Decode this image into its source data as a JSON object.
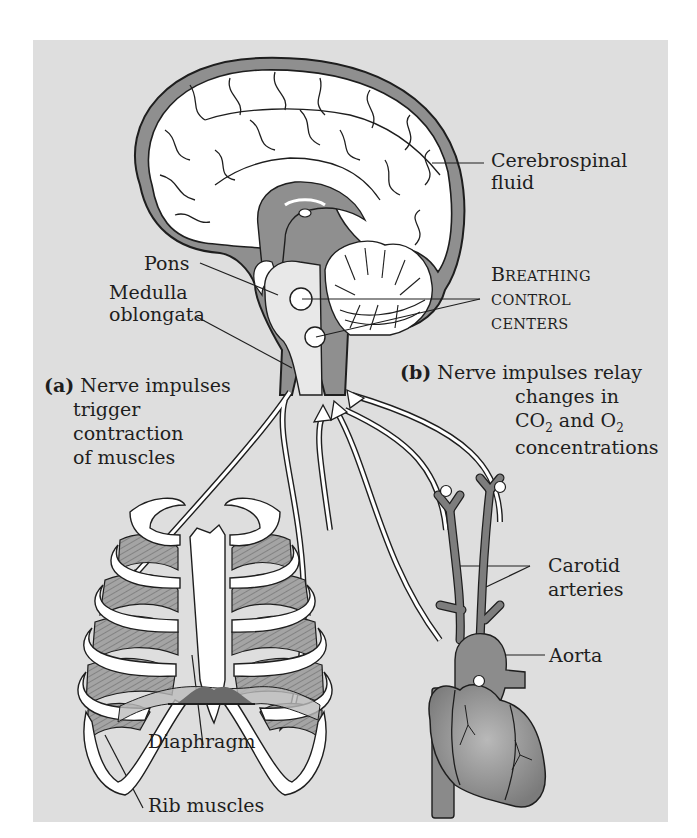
{
  "figure": {
    "colors": {
      "background": "#dedede",
      "csf": "#8f8f8f",
      "tissue_light": "#e8e8e8",
      "white": "#ffffff",
      "outline": "#1e1e1e",
      "vessel": "#7d7d7d",
      "muscle": "#9a9a9a"
    }
  },
  "labels": {
    "csf": {
      "line1": "Cerebrospinal",
      "line2": "fluid"
    },
    "pons": "Pons",
    "medulla": {
      "line1": "Medulla",
      "line2": "oblongata"
    },
    "breathing_centers": {
      "line1_cap": "B",
      "line1_rest": "REATHING",
      "line2": "CONTROL",
      "line3": "CENTERS"
    },
    "a": {
      "tag": "(a)",
      "line1": "Nerve impulses",
      "line2": "trigger",
      "line3": "contraction",
      "line4": "of muscles"
    },
    "b": {
      "tag": "(b)",
      "line1": "Nerve impulses relay",
      "line2": "changes in",
      "line3_co": "CO",
      "line3_sub1": "2",
      "line3_and": " and O",
      "line3_sub2": "2",
      "line4": "concentrations"
    },
    "carotid": {
      "line1": "Carotid",
      "line2": "arteries"
    },
    "aorta": "Aorta",
    "diaphragm": "Diaphragm",
    "rib_muscles": "Rib muscles"
  }
}
